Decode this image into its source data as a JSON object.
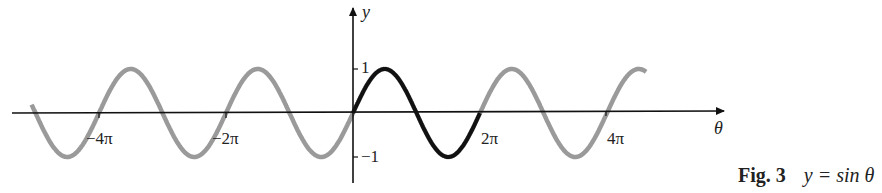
{
  "figure": {
    "caption_label": "Fig. 3",
    "caption_eq": "y  =  sin θ"
  },
  "axes": {
    "y_label": "y",
    "x_label": "θ",
    "y_ticks": [
      "1",
      "−1"
    ],
    "x_ticks": [
      "−4π",
      "−2π",
      "2π",
      "4π"
    ]
  },
  "colors": {
    "highlight": "#111111",
    "curve": "#9a9a9a",
    "axis": "#111111"
  },
  "chart_data": {
    "type": "line",
    "xlabel": "θ",
    "ylabel": "y",
    "x_ticks": [
      "-4π",
      "-2π",
      "2π",
      "4π"
    ],
    "y_ticks": [
      1,
      -1
    ],
    "xlim": [
      -16.0,
      14.8
    ],
    "ylim": [
      -1,
      1
    ],
    "series": [
      {
        "name": "sin θ (one period, highlighted)",
        "function": "sin(θ)",
        "domain": [
          0,
          6.2832
        ],
        "color": "#111111"
      },
      {
        "name": "sin θ (rest)",
        "function": "sin(θ)",
        "domain": [
          -15.9,
          14.5
        ],
        "color": "#9a9a9a"
      }
    ]
  }
}
